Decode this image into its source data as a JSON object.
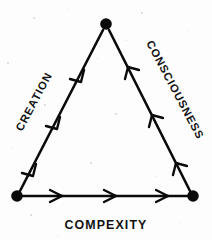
{
  "diagram": {
    "type": "cycle-triangle",
    "title": "",
    "background_color": "#fdfdfd",
    "ink_color": "#0a0a0a",
    "nodes": [
      {
        "id": "apex",
        "name": "apex-node",
        "x": 106,
        "y": 24,
        "radius": 5.6
      },
      {
        "id": "bottom-left",
        "name": "bottom-left-node",
        "x": 17,
        "y": 196,
        "radius": 5.6
      },
      {
        "id": "bottom-right",
        "name": "bottom-right-node",
        "x": 193,
        "y": 196,
        "radius": 5.6
      }
    ],
    "edges": [
      {
        "id": "creation",
        "label": "CREATION",
        "from": "apex",
        "to": "bottom-left",
        "direction": "down-left",
        "chevron_count": 3,
        "label_rotation": -62,
        "label_x": 22,
        "label_y": 132
      },
      {
        "id": "compexity",
        "label": "COMPEXITY",
        "from": "bottom-left",
        "to": "bottom-right",
        "direction": "right",
        "chevron_count": 3,
        "label_rotation": 0,
        "label_x": 106,
        "label_y": 229
      },
      {
        "id": "consciousness",
        "label": "CONSCIOUSNESS",
        "from": "bottom-right",
        "to": "apex",
        "direction": "up-left",
        "chevron_count": 3,
        "label_rotation": 62,
        "label_x": 146,
        "label_y": 43
      }
    ]
  }
}
